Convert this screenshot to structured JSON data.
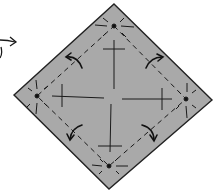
{
  "diagram": {
    "type": "origami-fold-step",
    "colors": {
      "paper": "#a9a9a9",
      "outline": "#222222",
      "lines": "#1a1a1a",
      "background": "#ffffff"
    },
    "paper_vertices": {
      "top": [
        114,
        4
      ],
      "right": [
        212,
        100
      ],
      "bottom": [
        109,
        189
      ],
      "left": [
        14,
        95
      ]
    },
    "center_point": [
      113,
      97
    ],
    "corner_points": [
      {
        "name": "top",
        "x": 114,
        "y": 26
      },
      {
        "name": "right",
        "x": 186,
        "y": 99
      },
      {
        "name": "bottom",
        "x": 109,
        "y": 166
      },
      {
        "name": "left",
        "x": 37,
        "y": 96
      }
    ],
    "fold_arrows": [
      {
        "name": "top-left",
        "x": 73,
        "y": 61
      },
      {
        "name": "top-right",
        "x": 154,
        "y": 61
      },
      {
        "name": "bottom-left",
        "x": 74,
        "y": 133
      },
      {
        "name": "bottom-right",
        "x": 152,
        "y": 133
      }
    ],
    "prev_arrow": {
      "x": 0,
      "y": 40
    }
  }
}
